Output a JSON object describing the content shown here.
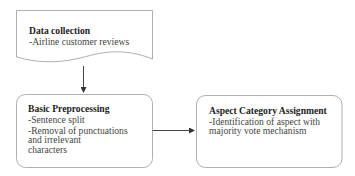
{
  "diagram": {
    "type": "flowchart",
    "nodes": [
      {
        "id": "data_collection",
        "shape": "document",
        "title": "Data collection",
        "lines": [
          "-Airline customer reviews"
        ]
      },
      {
        "id": "basic_preprocessing",
        "shape": "rounded-rectangle",
        "title": "Basic Preprocessing",
        "lines": [
          "-Sentence split",
          "-Removal of punctuations",
          "and irrelevant",
          "characters"
        ]
      },
      {
        "id": "aspect_category_assignment",
        "shape": "rounded-rectangle",
        "title": "Aspect Category Assignment",
        "lines": [
          "-Identification of aspect with",
          "majority vote mechanism"
        ]
      }
    ],
    "edges": [
      {
        "from": "data_collection",
        "to": "basic_preprocessing",
        "direction": "down"
      },
      {
        "from": "basic_preprocessing",
        "to": "aspect_category_assignment",
        "direction": "right"
      }
    ],
    "colors": {
      "stroke": "#8c8c8c",
      "arrow": "#333333",
      "fill": "#ffffff"
    }
  }
}
